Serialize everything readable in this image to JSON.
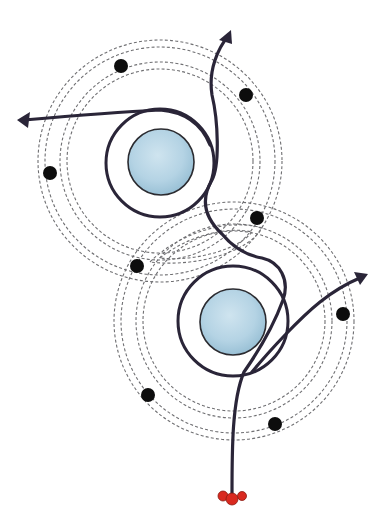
{
  "diagram": {
    "type": "trajectory-diagram",
    "colors": {
      "background": "#ffffff",
      "path": "#2a2538",
      "orbit_dash": "#6f6f72",
      "planet_fill": "#b9d6e6",
      "planet_shade": "#8fb8cf",
      "marker_dot": "#0d0d0d",
      "start_point": "#d9291f"
    },
    "planets": [
      {
        "id": "upper-planet",
        "cx": 161,
        "cy": 162,
        "r": 33
      },
      {
        "id": "lower-planet",
        "cx": 233,
        "cy": 322,
        "r": 33
      }
    ],
    "orbit_systems": [
      {
        "id": "upper-orbits",
        "cx": 160,
        "cy": 161,
        "radii": [
          122,
          115,
          100,
          93
        ]
      },
      {
        "id": "lower-orbits",
        "cx": 234,
        "cy": 321,
        "radii": [
          120,
          113,
          98,
          91
        ]
      }
    ],
    "marker_dots": [
      {
        "x": 121,
        "y": 66
      },
      {
        "x": 246,
        "y": 95
      },
      {
        "x": 50,
        "y": 173
      },
      {
        "x": 257,
        "y": 218
      },
      {
        "x": 137,
        "y": 266
      },
      {
        "x": 343,
        "y": 314
      },
      {
        "x": 148,
        "y": 395
      },
      {
        "x": 275,
        "y": 424
      }
    ],
    "start_point": {
      "x": 232,
      "y": 497
    },
    "arrows": [
      {
        "id": "arrow-up",
        "tip": {
          "x": 231,
          "y": 32
        }
      },
      {
        "id": "arrow-left",
        "tip": {
          "x": 19,
          "y": 120
        }
      },
      {
        "id": "arrow-right",
        "tip": {
          "x": 366,
          "y": 275
        }
      }
    ]
  }
}
